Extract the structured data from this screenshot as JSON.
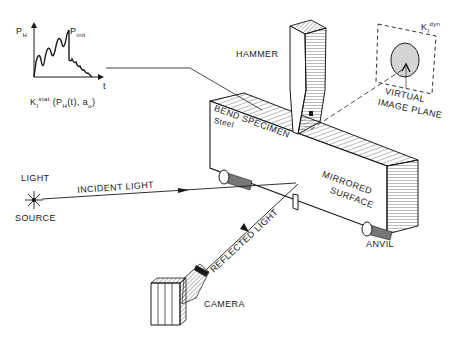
{
  "diagram": {
    "type": "experimental-setup"
  },
  "graph": {
    "y_axis": "P",
    "y_axis_sub": "H",
    "x_axis": "t",
    "peak_label": "P",
    "peak_sub": "init",
    "formula_k": "K",
    "formula_k_sub": "I",
    "formula_k_sup": "stat",
    "formula_args": "(P",
    "formula_args_sub": "H",
    "formula_args_rest": "(t), a",
    "formula_a_sub": "o",
    "formula_close": ")"
  },
  "labels": {
    "hammer": "HAMMER",
    "bend_specimen": "BEND SPECIMEN",
    "steel": "Steel",
    "mirrored_line1": "MIRRORED",
    "mirrored_line2": "SURFACE",
    "anvil": "ANVIL",
    "light_line1": "LIGHT",
    "light_line2": "SOURCE",
    "incident_light": "INCIDENT LIGHT",
    "reflected_light": "REFLECTED LIGHT",
    "camera": "CAMERA",
    "virtual_line1": "VIRTUAL",
    "virtual_line2": "IMAGE PLANE",
    "kdyn_k": "K",
    "kdyn_sub": "I",
    "kdyn_sup": "dyn"
  },
  "colors": {
    "ink": "#1a1a1a",
    "caustic_fill": "#d4d4d4",
    "background": "#ffffff"
  }
}
